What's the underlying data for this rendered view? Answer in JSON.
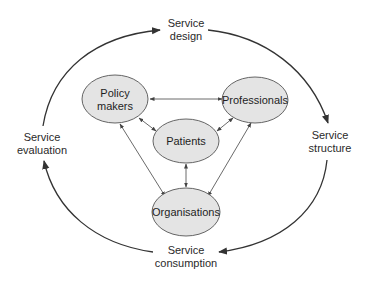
{
  "diagram": {
    "type": "cycle-with-stakeholder-network",
    "outer_cycle": {
      "stages": [
        {
          "id": "design",
          "line1": "Service",
          "line2": "design"
        },
        {
          "id": "structure",
          "line1": "Service",
          "line2": "structure"
        },
        {
          "id": "consumption",
          "line1": "Service",
          "line2": "consumption"
        },
        {
          "id": "evaluation",
          "line1": "Service",
          "line2": "evaluation"
        }
      ],
      "direction": "clockwise",
      "flow": [
        "Service design",
        "Service structure",
        "Service consumption",
        "Service evaluation",
        "Service design"
      ]
    },
    "nodes": [
      {
        "id": "policy_makers",
        "line1": "Policy",
        "line2": "makers"
      },
      {
        "id": "professionals",
        "line1": "Professionals",
        "line2": ""
      },
      {
        "id": "patients",
        "line1": "Patients",
        "line2": ""
      },
      {
        "id": "organisations",
        "line1": "Organisations",
        "line2": ""
      }
    ],
    "edges": [
      {
        "from": "Policy makers",
        "to": "Professionals",
        "type": "bidirectional"
      },
      {
        "from": "Policy makers",
        "to": "Patients",
        "type": "bidirectional"
      },
      {
        "from": "Policy makers",
        "to": "Organisations",
        "type": "bidirectional"
      },
      {
        "from": "Professionals",
        "to": "Patients",
        "type": "bidirectional"
      },
      {
        "from": "Professionals",
        "to": "Organisations",
        "type": "bidirectional"
      },
      {
        "from": "Patients",
        "to": "Organisations",
        "type": "bidirectional"
      }
    ],
    "colors": {
      "node_fill": "#e4e4e4",
      "node_stroke": "#555555",
      "line": "#444444",
      "text": "#2a2a2a",
      "background": "#ffffff"
    }
  }
}
